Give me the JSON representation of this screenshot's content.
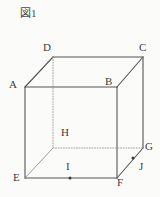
{
  "figure": {
    "title": "図1",
    "type": "cube-with-marked-points",
    "background_color": "#fbfbfa",
    "stroke_color": "#555555",
    "hidden_stroke_color": "#9a9a9a",
    "label_color": "#3d3d3d"
  },
  "vertices": [
    {
      "name": "A",
      "label": "A",
      "x": 25,
      "y": 87,
      "label_x": 9,
      "label_y": 79,
      "visible": true
    },
    {
      "name": "B",
      "label": "B",
      "x": 117,
      "y": 87,
      "label_x": 105,
      "label_y": 76,
      "visible": true
    },
    {
      "name": "C",
      "label": "C",
      "x": 143,
      "y": 57,
      "label_x": 139,
      "label_y": 42,
      "visible": true
    },
    {
      "name": "D",
      "label": "D",
      "x": 53,
      "y": 57,
      "label_x": 43,
      "label_y": 42,
      "visible": true
    },
    {
      "name": "E",
      "label": "E",
      "x": 25,
      "y": 178,
      "label_x": 13,
      "label_y": 172,
      "visible": true
    },
    {
      "name": "F",
      "label": "F",
      "x": 117,
      "y": 178,
      "label_x": 117,
      "label_y": 177,
      "visible": true
    },
    {
      "name": "G",
      "label": "G",
      "x": 143,
      "y": 148,
      "label_x": 145,
      "label_y": 141,
      "visible": true
    },
    {
      "name": "H",
      "label": "H",
      "x": 53,
      "y": 148,
      "label_x": 61,
      "label_y": 127,
      "visible": false
    }
  ],
  "marked_points": [
    {
      "name": "I",
      "label": "I",
      "x": 70,
      "y": 178,
      "label_x": 66,
      "label_y": 161,
      "on_edge": "EF"
    },
    {
      "name": "J",
      "label": "J",
      "x": 133,
      "y": 158,
      "label_x": 139,
      "label_y": 161,
      "on_edge": "FG"
    }
  ],
  "edges": [
    {
      "from": "A",
      "to": "B",
      "style": "solid"
    },
    {
      "from": "B",
      "to": "F",
      "style": "solid"
    },
    {
      "from": "F",
      "to": "E",
      "style": "solid"
    },
    {
      "from": "E",
      "to": "A",
      "style": "solid"
    },
    {
      "from": "D",
      "to": "C",
      "style": "solid"
    },
    {
      "from": "C",
      "to": "G",
      "style": "solid"
    },
    {
      "from": "A",
      "to": "D",
      "style": "solid"
    },
    {
      "from": "B",
      "to": "C",
      "style": "solid"
    },
    {
      "from": "F",
      "to": "G",
      "style": "solid"
    },
    {
      "from": "E",
      "to": "H",
      "style": "thin"
    },
    {
      "from": "D",
      "to": "H",
      "style": "dotted"
    },
    {
      "from": "H",
      "to": "G",
      "style": "dotted"
    }
  ]
}
